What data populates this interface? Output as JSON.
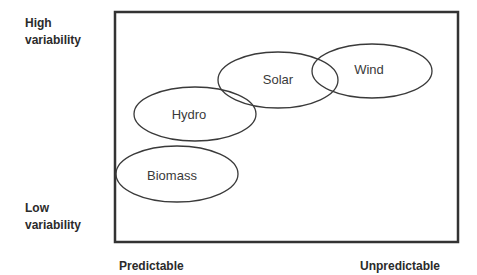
{
  "diagram": {
    "y_axis": {
      "top_label_line1": "High",
      "top_label_line2": "variability",
      "bottom_label_line1": "Low",
      "bottom_label_line2": "variability"
    },
    "x_axis": {
      "left_label": "Predictable",
      "right_label": "Unpredictable"
    },
    "nodes": [
      {
        "label": "Solar",
        "cx": 278,
        "cy": 80,
        "rx": 60,
        "ry": 28
      },
      {
        "label": "Wind",
        "cx": 372,
        "cy": 71,
        "rx": 60,
        "ry": 27
      },
      {
        "label": "Hydro",
        "cx": 195,
        "cy": 114,
        "rx": 61,
        "ry": 27
      },
      {
        "label": "Biomass",
        "cx": 177,
        "cy": 174,
        "rx": 61,
        "ry": 28
      }
    ],
    "colors": {
      "frame": "#333333",
      "ellipse_stroke": "#3a3a3a",
      "text": "#2b2b2b"
    }
  }
}
